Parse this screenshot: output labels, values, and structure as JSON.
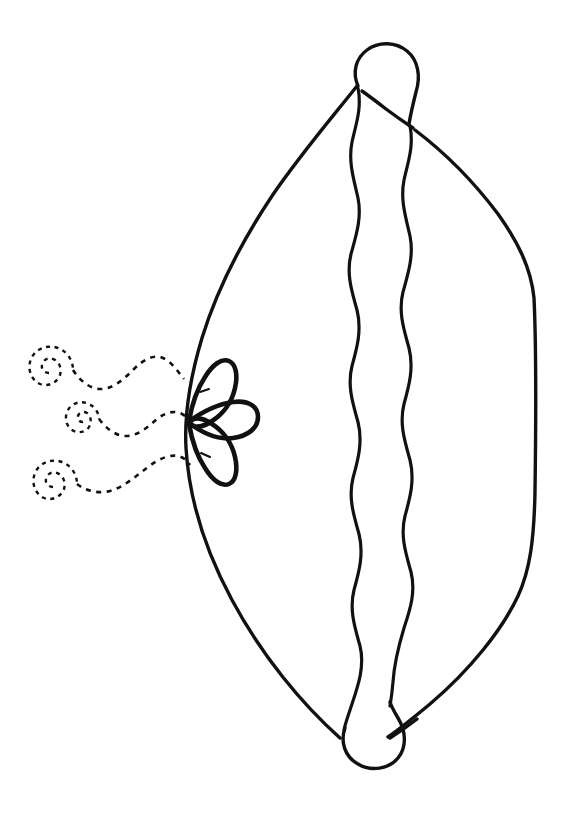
{
  "page": {
    "title": "Line Art Coloring Page",
    "width": 571,
    "height": 821,
    "background_color": "#ffffff",
    "ink_color": "#111111"
  },
  "artwork": {
    "name": "pillow-with-petals-and-swirls",
    "stroke_color": "#111111",
    "fill_color": "none",
    "elements": {
      "body": {
        "name": "pillow-body-outline",
        "label": "Pillow body outline"
      },
      "ruffle": {
        "name": "wavy-ruffle-spine",
        "label": "Wavy ruffle spine",
        "wave_count": 9
      },
      "knob_top": {
        "name": "top-knob",
        "label": "Top rounded knob"
      },
      "knob_bottom": {
        "name": "bottom-knob",
        "label": "Bottom rounded knob"
      },
      "petals": {
        "name": "petal-cluster",
        "label": "Three teardrop petals",
        "count": 3,
        "items": [
          {
            "name": "petal-upper",
            "label": "Upper teardrop petal"
          },
          {
            "name": "petal-middle",
            "label": "Middle teardrop petal"
          },
          {
            "name": "petal-lower",
            "label": "Lower teardrop petal"
          }
        ]
      },
      "swirls": {
        "name": "dashed-swirl-group",
        "label": "Three dashed spiral trails",
        "count": 3,
        "style": "dashed",
        "items": [
          {
            "name": "swirl-top",
            "label": "Top dashed spiral trail"
          },
          {
            "name": "swirl-middle",
            "label": "Middle dashed spiral trail"
          },
          {
            "name": "swirl-bottom",
            "label": "Bottom dashed spiral trail"
          }
        ]
      }
    }
  },
  "chart_data": {
    "type": "line",
    "title": "Line Art Coloring Page",
    "xlabel": "",
    "ylabel": "",
    "categories": [],
    "values": []
  }
}
